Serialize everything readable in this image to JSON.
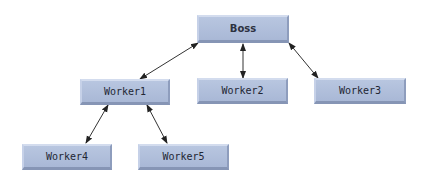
{
  "diagram": {
    "type": "hierarchy",
    "nodes": [
      {
        "id": "boss",
        "label": "Boss"
      },
      {
        "id": "worker1",
        "label": "Worker1"
      },
      {
        "id": "worker2",
        "label": "Worker2"
      },
      {
        "id": "worker3",
        "label": "Worker3"
      },
      {
        "id": "worker4",
        "label": "Worker4"
      },
      {
        "id": "worker5",
        "label": "Worker5"
      }
    ],
    "edges": [
      {
        "from": "boss",
        "to": "worker1",
        "bidirectional": true
      },
      {
        "from": "boss",
        "to": "worker2",
        "bidirectional": true
      },
      {
        "from": "boss",
        "to": "worker3",
        "bidirectional": true
      },
      {
        "from": "worker1",
        "to": "worker4",
        "bidirectional": true
      },
      {
        "from": "worker1",
        "to": "worker5",
        "bidirectional": true
      }
    ],
    "colors": {
      "node_fill": "#aebcd9",
      "edge": "#222222"
    }
  }
}
